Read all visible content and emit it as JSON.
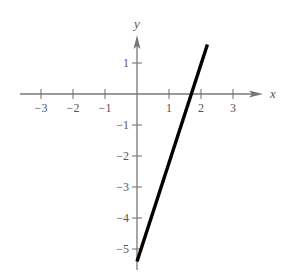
{
  "chart_data": {
    "type": "line",
    "title": "",
    "xlabel": "x",
    "ylabel": "y",
    "xlim": [
      -3.3,
      3.9
    ],
    "ylim": [
      -5.5,
      1.9
    ],
    "grid": false,
    "x_ticks": [
      -3,
      -2,
      -1,
      1,
      2,
      3
    ],
    "y_ticks": [
      1,
      -1,
      -2,
      -3,
      -4,
      -5
    ],
    "x_tick_labels": [
      "−3",
      "−2",
      "−1",
      "1",
      "2",
      "3"
    ],
    "y_tick_labels": [
      "1",
      "−1",
      "−2",
      "−3",
      "−4",
      "−5"
    ],
    "series": [
      {
        "name": "y = 3x − 5",
        "x": [
          0,
          2.2
        ],
        "y": [
          -5.4,
          1.6
        ],
        "color": "#000000"
      }
    ]
  },
  "style": {
    "axis_color": "#777777",
    "line_color": "#000000",
    "origin_px": [
      137,
      94
    ],
    "unit_x_px": 32,
    "unit_y_px": 31
  }
}
